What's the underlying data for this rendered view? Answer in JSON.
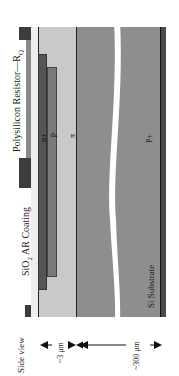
{
  "diagram": {
    "orientation": "rotated-90-ccw",
    "labels": {
      "polysilicon_resistor": "Polysilicon Resistor—R",
      "polysilicon_resistor_sub": "Q",
      "sio2_prefix": "SiO",
      "sio2_sub": "2",
      "sio2_suffix": " AR Coating",
      "n_plus": "n+",
      "p": "p",
      "pi": "π",
      "p_plus": "P+",
      "si_substrate": "Si Substrate",
      "side_view": "Side view",
      "dim_3um": "~3 μm",
      "dim_300um": "~300 μm"
    },
    "colors": {
      "resistor_pad": "#3c3c3c",
      "resistor_body": "#8a8a8a",
      "sio2": "#eeeeee",
      "n_plus": "#555555",
      "p": "#777777",
      "pi": "#c8c8c8",
      "substrate": "#8e8e8e",
      "backside": "#4a4a4a",
      "line": "#222222"
    }
  }
}
